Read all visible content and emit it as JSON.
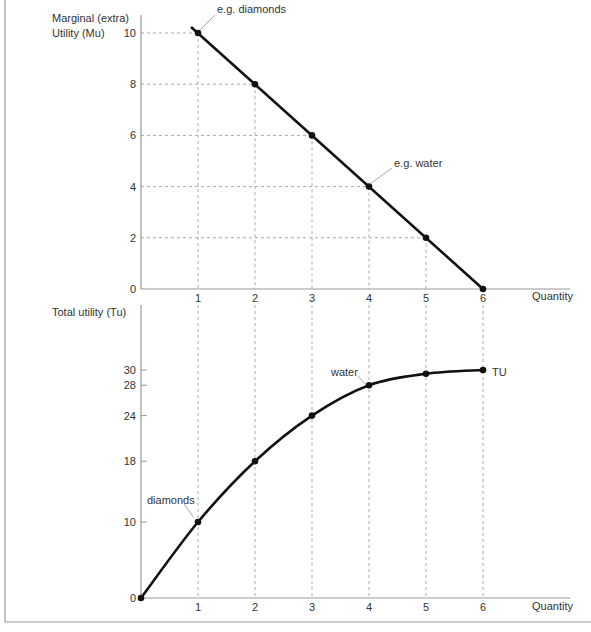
{
  "chart_data": [
    {
      "type": "line",
      "title": "",
      "ylabel": "Marginal (extra) Utility (Mu)",
      "ylabel_lines": [
        "Marginal (extra)",
        "Utility (Mu)"
      ],
      "xlabel": "Quantity",
      "x": [
        1,
        2,
        3,
        4,
        5,
        6
      ],
      "xticks": [
        "1",
        "2",
        "3",
        "4",
        "5",
        "6"
      ],
      "yticks": [
        "0",
        "2",
        "4",
        "6",
        "8",
        "10"
      ],
      "ytick_values": [
        0,
        2,
        4,
        6,
        8,
        10
      ],
      "series": [
        {
          "name": "Mu",
          "values": [
            10,
            8,
            6,
            4,
            2,
            0
          ]
        }
      ],
      "annotations": [
        {
          "text": "e.g. diamonds",
          "x": 1,
          "y": 10
        },
        {
          "text": "e.g. water",
          "x": 4,
          "y": 4
        }
      ],
      "xlim": [
        0,
        6.8
      ],
      "ylim": [
        0,
        10.7
      ],
      "grid": "dashed guide lines to each point"
    },
    {
      "type": "line",
      "title": "",
      "ylabel": "Total utility (Tu)",
      "xlabel": "Quantity",
      "x": [
        0,
        1,
        2,
        3,
        4,
        5,
        6
      ],
      "xticks": [
        "1",
        "2",
        "3",
        "4",
        "5",
        "6"
      ],
      "yticks": [
        "0",
        "10",
        "18",
        "24",
        "28",
        "30"
      ],
      "ytick_values": [
        0,
        10,
        18,
        24,
        28,
        30
      ],
      "series": [
        {
          "name": "TU",
          "values": [
            0,
            10,
            18,
            24,
            28,
            29.5,
            30
          ]
        }
      ],
      "annotations": [
        {
          "text": "diamonds",
          "x": 1,
          "y": 10
        },
        {
          "text": "water",
          "x": 4,
          "y": 28
        },
        {
          "text": "TU",
          "x": 6,
          "y": 30
        }
      ],
      "xlim": [
        0,
        6.8
      ],
      "ylim": [
        0,
        38
      ],
      "grid": "vertical dashed lines at quantities"
    }
  ],
  "labels": {
    "top_ylabel_1": "Marginal (extra)",
    "top_ylabel_2": "Utility (Mu)",
    "top_xlabel": "Quantity",
    "top_ann_diamonds": "e.g. diamonds",
    "top_ann_water": "e.g. water",
    "bottom_ylabel": "Total utility (Tu)",
    "bottom_xlabel": "Quantity",
    "bottom_ann_diamonds": "diamonds",
    "bottom_ann_water": "water",
    "bottom_series_label": "TU"
  }
}
